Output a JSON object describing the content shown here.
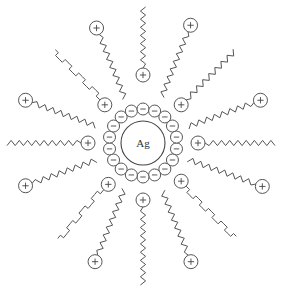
{
  "diagram": {
    "center": {
      "x": 143,
      "y": 143
    },
    "core": {
      "label": "Ag",
      "radius": 22
    },
    "colors": {
      "stroke": "#555555",
      "background": "#ffffff",
      "text": "#333333"
    },
    "anion_ring": {
      "radius": 34,
      "count": 18,
      "ion_radius": 6,
      "sign": "minus"
    },
    "surfactants": [
      {
        "angle": -90,
        "head": "inner",
        "head_r": 68,
        "tail_end_r": 136,
        "chain_style": "fine"
      },
      {
        "angle": -112,
        "head": "outer",
        "head_r": 124,
        "tail_end_r": 48,
        "chain_style": "fine"
      },
      {
        "angle": -135,
        "head": "inner",
        "head_r": 54,
        "tail_end_r": 128,
        "chain_style": "step"
      },
      {
        "angle": -160,
        "head": "outer",
        "head_r": 125,
        "tail_end_r": 50,
        "chain_style": "fine"
      },
      {
        "angle": 180,
        "head": "inner",
        "head_r": 55,
        "tail_end_r": 136,
        "chain_style": "fine"
      },
      {
        "angle": 160,
        "head": "outer",
        "head_r": 125,
        "tail_end_r": 50,
        "chain_style": "fine"
      },
      {
        "angle": 130,
        "head": "inner",
        "head_r": 54,
        "tail_end_r": 128,
        "chain_style": "step"
      },
      {
        "angle": 112,
        "head": "outer",
        "head_r": 128,
        "tail_end_r": 50,
        "chain_style": "fine"
      },
      {
        "angle": 90,
        "head": "inner",
        "head_r": 57,
        "tail_end_r": 142,
        "chain_style": "fine"
      },
      {
        "angle": 68,
        "head": "outer",
        "head_r": 128,
        "tail_end_r": 52,
        "chain_style": "fine"
      },
      {
        "angle": 45,
        "head": "inner",
        "head_r": 54,
        "tail_end_r": 132,
        "chain_style": "step"
      },
      {
        "angle": 20,
        "head": "outer",
        "head_r": 127,
        "tail_end_r": 48,
        "chain_style": "fine"
      },
      {
        "angle": 0,
        "head": "inner",
        "head_r": 55,
        "tail_end_r": 132,
        "chain_style": "fine"
      },
      {
        "angle": -20,
        "head": "outer",
        "head_r": 125,
        "tail_end_r": 48,
        "chain_style": "fine"
      },
      {
        "angle": -45,
        "head": "inner",
        "head_r": 54,
        "tail_end_r": 130,
        "chain_style": "fine"
      },
      {
        "angle": -68,
        "head": "outer",
        "head_r": 127,
        "tail_end_r": 50,
        "chain_style": "fine"
      }
    ],
    "head_sign": "plus",
    "head_radius": 7
  }
}
